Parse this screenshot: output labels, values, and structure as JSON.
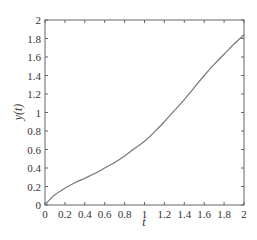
{
  "chart_data": {
    "type": "line",
    "title": "",
    "xlabel": "t",
    "ylabel": "y(t)",
    "xlim": [
      0,
      2
    ],
    "ylim": [
      0,
      2
    ],
    "grid": false,
    "legend": null,
    "x_ticks": [
      "0",
      "0.2",
      "0.4",
      "0.6",
      "0.8",
      "1",
      "1.2",
      "1.4",
      "1.6",
      "1.8",
      "2"
    ],
    "y_ticks": [
      "0",
      "0.2",
      "0.4",
      "0.6",
      "0.8",
      "1",
      "1.2",
      "1.4",
      "1.6",
      "1.8",
      "2"
    ],
    "series": [
      {
        "name": "y(t)",
        "color": "#777777",
        "x": [
          0,
          0.05,
          0.1,
          0.2,
          0.3,
          0.4,
          0.5,
          0.6,
          0.7,
          0.8,
          0.9,
          1.0,
          1.1,
          1.2,
          1.3,
          1.4,
          1.5,
          1.6,
          1.7,
          1.8,
          1.9,
          2.0
        ],
        "y": [
          0,
          0.06,
          0.11,
          0.18,
          0.24,
          0.29,
          0.34,
          0.4,
          0.46,
          0.53,
          0.61,
          0.69,
          0.79,
          0.9,
          1.02,
          1.14,
          1.27,
          1.4,
          1.52,
          1.63,
          1.74,
          1.84
        ]
      }
    ]
  }
}
